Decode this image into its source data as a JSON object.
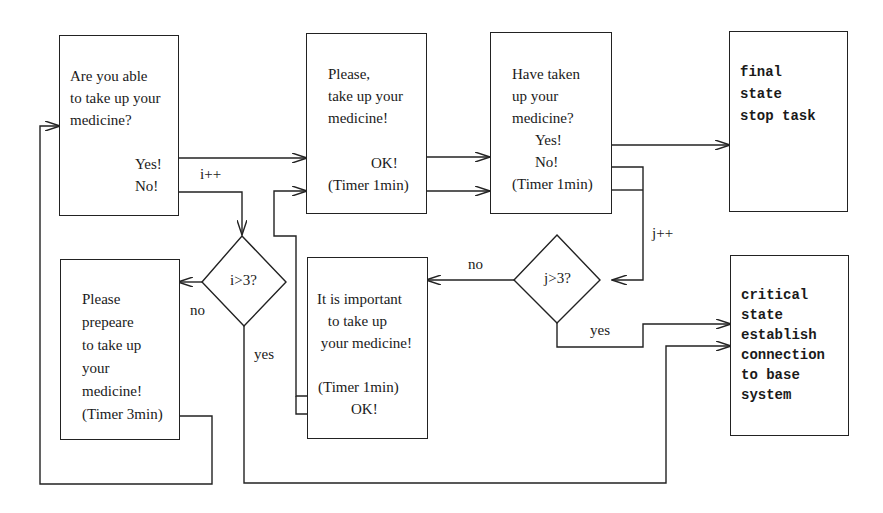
{
  "diagram": {
    "nodes": {
      "ask_able": {
        "lines": [
          "Are you able",
          "to take up your",
          "medicine?"
        ],
        "yes": "Yes!",
        "no": "No!"
      },
      "please_take": {
        "lines": [
          "Please,",
          "take up your",
          "medicine!"
        ],
        "ok": "OK!",
        "timer": "(Timer 1min)"
      },
      "have_taken": {
        "lines": [
          "Have taken",
          "up your",
          "medicine?"
        ],
        "yes": "Yes!",
        "no": "No!",
        "timer": "(Timer 1min)"
      },
      "final_state": {
        "lines": [
          "final",
          "state",
          "stop task"
        ]
      },
      "prepare": {
        "lines": [
          "Please",
          "prepeare",
          "to take up",
          "your",
          "medicine!",
          "(Timer 3min)"
        ]
      },
      "important": {
        "lines": [
          "It is important",
          " to take up",
          " your medicine!"
        ],
        "timer": "(Timer 1min)",
        "ok": "OK!"
      },
      "critical_state": {
        "lines": [
          "critical",
          "state",
          "establish",
          "connection",
          "to base",
          "system"
        ]
      },
      "decision_i": {
        "label": "i>3?"
      },
      "decision_j": {
        "label": "j>3?"
      }
    },
    "edge_labels": {
      "i_inc": "i++",
      "j_inc": "j++",
      "i_no": "no",
      "i_yes": "yes",
      "j_no": "no",
      "j_yes": "yes"
    }
  }
}
